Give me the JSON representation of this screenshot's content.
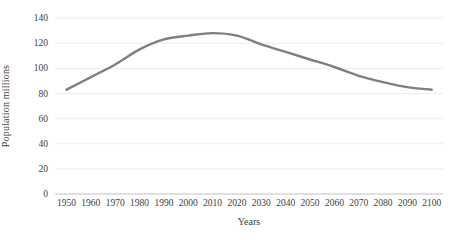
{
  "chart_data": {
    "type": "line",
    "title": "",
    "xlabel": "Years",
    "ylabel": "Population millions",
    "x": [
      "1950",
      "1960",
      "1970",
      "1980",
      "1990",
      "2000",
      "2010",
      "2020",
      "2030",
      "2040",
      "2050",
      "2060",
      "2070",
      "2080",
      "2090",
      "2100"
    ],
    "series": [
      {
        "name": "Population",
        "color": "#7f7f7f",
        "values": [
          83,
          93,
          103,
          115,
          123,
          126,
          128,
          126,
          119,
          113,
          107,
          101,
          94,
          89,
          85,
          83
        ]
      }
    ],
    "ylim": [
      0,
      140
    ],
    "yticks": [
      0,
      20,
      40,
      60,
      80,
      100,
      120,
      140
    ],
    "ytick_step": 20,
    "grid": true,
    "legend": "none",
    "markers": false,
    "smooth": true
  },
  "colors": {
    "background": "#ffffff",
    "gridline": "#ececec",
    "axis_line": "#c0c0c0",
    "tick_text": "#404040",
    "line": "#7f7f7f"
  }
}
